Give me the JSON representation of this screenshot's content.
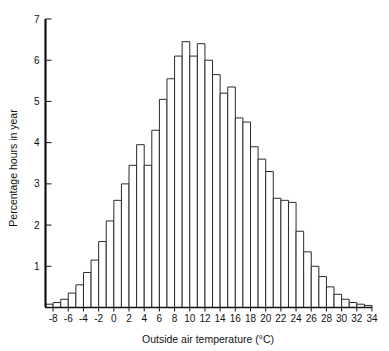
{
  "chart_data": {
    "type": "bar",
    "title": "",
    "subtitle": "",
    "xlabel": "Outside air temperature (°C)",
    "ylabel": "Percentage hours in year",
    "xlim": [
      -9,
      34
    ],
    "ylim": [
      0,
      7
    ],
    "grid": false,
    "legend": null,
    "bin_width": 1,
    "xticks": [
      -8,
      -6,
      -4,
      -2,
      0,
      2,
      4,
      6,
      8,
      10,
      12,
      14,
      16,
      18,
      20,
      22,
      24,
      26,
      28,
      30,
      32,
      34
    ],
    "xticklabels": [
      "-8",
      "-6",
      "-4",
      "-2",
      "0",
      "2",
      "4",
      "6",
      "8",
      "10",
      "12",
      "14",
      "16",
      "18",
      "20",
      "22",
      "24",
      "26",
      "28",
      "30",
      "32",
      "34"
    ],
    "yticks": [
      0,
      1,
      2,
      3,
      4,
      5,
      6,
      7
    ],
    "yticklabels": [
      "",
      "1",
      "2",
      "3",
      "4",
      "5",
      "6",
      "7"
    ],
    "bin_starts": [
      -9,
      -8,
      -7,
      -6,
      -5,
      -4,
      -3,
      -2,
      -1,
      0,
      1,
      2,
      3,
      4,
      5,
      6,
      7,
      8,
      9,
      10,
      11,
      12,
      13,
      14,
      15,
      16,
      17,
      18,
      19,
      20,
      21,
      22,
      23,
      24,
      25,
      26,
      27,
      28,
      29,
      30,
      31,
      32,
      33
    ],
    "categories": [
      "-9",
      "-8",
      "-7",
      "-6",
      "-5",
      "-4",
      "-3",
      "-2",
      "-1",
      "0",
      "1",
      "2",
      "3",
      "4",
      "5",
      "6",
      "7",
      "8",
      "9",
      "10",
      "11",
      "12",
      "13",
      "14",
      "15",
      "16",
      "17",
      "18",
      "19",
      "20",
      "21",
      "22",
      "23",
      "24",
      "25",
      "26",
      "27",
      "28",
      "29",
      "30",
      "31",
      "32",
      "33"
    ],
    "values": [
      0.08,
      0.12,
      0.2,
      0.35,
      0.55,
      0.85,
      1.15,
      1.6,
      2.1,
      2.6,
      3.0,
      3.45,
      3.95,
      3.45,
      4.3,
      5.05,
      5.55,
      6.1,
      6.45,
      6.1,
      6.4,
      6.0,
      5.65,
      5.2,
      5.35,
      4.6,
      4.5,
      3.9,
      3.6,
      3.3,
      2.65,
      2.6,
      2.55,
      1.85,
      1.35,
      1.0,
      0.75,
      0.5,
      0.32,
      0.2,
      0.12,
      0.08,
      0.05
    ],
    "units": "percentage of hours in year"
  },
  "axes": {
    "x_title": "Outside air temperature (°C)",
    "y_title": "Percentage hours in year"
  }
}
